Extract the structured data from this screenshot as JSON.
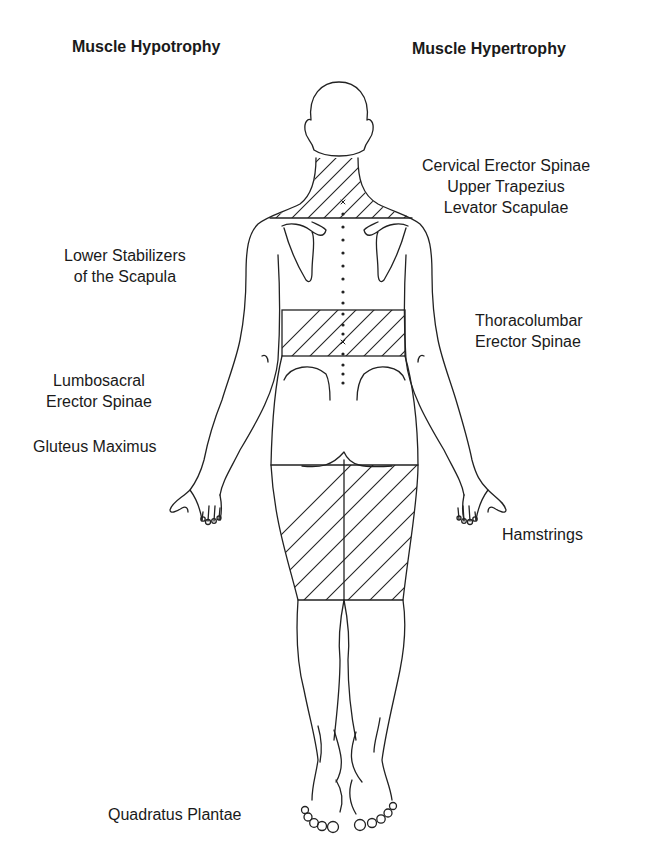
{
  "diagram": {
    "type": "anatomical-posterior-view",
    "headings": {
      "left": "Muscle Hypotrophy",
      "right": "Muscle Hypertrophy"
    },
    "hypotrophy_labels": [
      {
        "id": "lower-stabilizers",
        "lines": [
          "Lower Stabilizers",
          "of the Scapula"
        ]
      },
      {
        "id": "lumbosacral-erector-spinae",
        "lines": [
          "Lumbosacral",
          "Erector Spinae"
        ]
      },
      {
        "id": "gluteus-maximus",
        "lines": [
          "Gluteus Maximus"
        ]
      },
      {
        "id": "quadratus-plantae",
        "lines": [
          "Quadratus Plantae"
        ]
      }
    ],
    "hypertrophy_labels": [
      {
        "id": "cervical-upper-trap-levator",
        "lines": [
          "Cervical Erector Spinae",
          "Upper Trapezius",
          "Levator Scapulae"
        ]
      },
      {
        "id": "thoracolumbar-erector-spinae",
        "lines": [
          "Thoracolumbar",
          "Erector Spinae"
        ]
      },
      {
        "id": "hamstrings",
        "lines": [
          "Hamstrings"
        ]
      }
    ],
    "hatched_regions": [
      "neck-upper-trapezius",
      "thoracolumbar-band",
      "hamstrings-band"
    ],
    "colors": {
      "line": "#222222",
      "background": "#ffffff",
      "text": "#1a1a1a"
    }
  }
}
